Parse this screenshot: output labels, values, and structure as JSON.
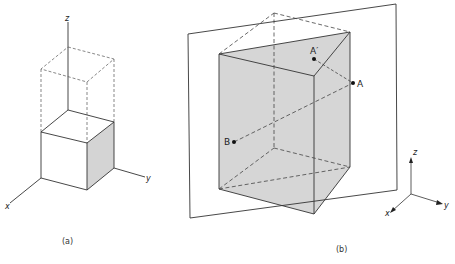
{
  "figure": {
    "panel_a": {
      "caption": "(a)",
      "axes": {
        "x": "x",
        "y": "y",
        "z": "z"
      },
      "description": "Unit cube at origin with dashed translated copy above along z"
    },
    "panel_b": {
      "caption": "(b)",
      "points": {
        "A": "A",
        "A_prime": "A′",
        "B": "B"
      },
      "axes": {
        "x": "x",
        "y": "y",
        "z": "z"
      },
      "description": "Box cut by diagonal plane; points A, A′ reflected across plane and B"
    }
  },
  "colors": {
    "line": "#333333",
    "shade": "#d6d6d6",
    "shade_side": "#cfcfcf",
    "background": "#ffffff"
  }
}
